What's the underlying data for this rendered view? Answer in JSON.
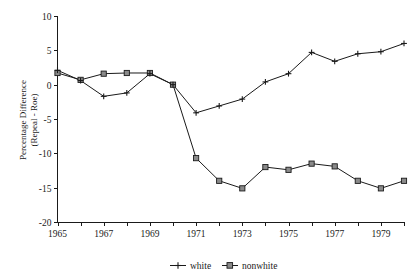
{
  "chart_data": {
    "type": "line",
    "title": "",
    "subtitle": "",
    "xlabel": "",
    "ylabel": "Percentage Difference\n(Repeal - Roe)",
    "ylabel_line1": "Percentage Difference",
    "ylabel_line2": "(Repeal - Roe)",
    "x": [
      1965,
      1966,
      1967,
      1968,
      1969,
      1970,
      1971,
      1972,
      1973,
      1974,
      1975,
      1976,
      1977,
      1978,
      1979,
      1980
    ],
    "xlim": [
      1965,
      1980
    ],
    "ylim": [
      -20,
      10
    ],
    "yticks": [
      10,
      5,
      0,
      -5,
      -10,
      -15,
      -20
    ],
    "ytick_labels": [
      "10",
      "5",
      "0",
      "-5",
      "-10",
      "-15",
      "-20"
    ],
    "xticks_major": [
      1965,
      1967,
      1969,
      1971,
      1973,
      1975,
      1977,
      1979
    ],
    "xtick_labels": [
      "1965",
      "1967",
      "1969",
      "1971",
      "1973",
      "1975",
      "1977",
      "1979"
    ],
    "xticks_minor": [
      1966,
      1968,
      1970,
      1972,
      1974,
      1976,
      1978,
      1980
    ],
    "grid": false,
    "legend_position": "bottom",
    "series": [
      {
        "name": "white",
        "marker": "plus",
        "color": "#1a1a1a",
        "values": [
          2.1,
          0.6,
          -1.7,
          -1.2,
          1.6,
          0.0,
          -4.1,
          -3.1,
          -2.1,
          0.4,
          1.6,
          4.7,
          3.4,
          4.5,
          4.8,
          6.0
        ]
      },
      {
        "name": "nonwhite",
        "marker": "square",
        "color": "#1a1a1a",
        "values": [
          1.7,
          0.7,
          1.6,
          1.7,
          1.7,
          0.0,
          -10.7,
          -14.0,
          -15.1,
          -12.0,
          -12.4,
          -11.5,
          -11.9,
          -14.0,
          -15.1,
          -14.0
        ]
      }
    ]
  },
  "legend": {
    "items": [
      {
        "label": "white"
      },
      {
        "label": "nonwhite"
      }
    ]
  },
  "colors": {
    "axis": "#1a1a1a",
    "series_white": "#1a1a1a",
    "series_nonwhite": "#1a1a1a",
    "marker_fill": "#8a8a8a",
    "background": "#ffffff"
  }
}
